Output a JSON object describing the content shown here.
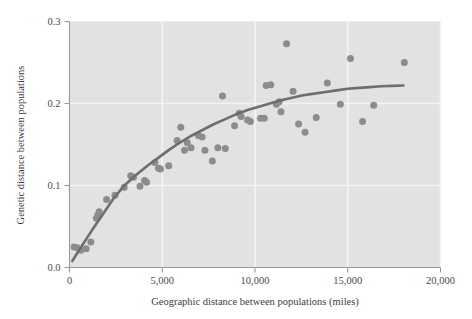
{
  "chart_data": {
    "type": "scatter",
    "title": "",
    "xlabel": "Geographic distance between populations (miles)",
    "ylabel": "Genetic distance between populations",
    "xlim": [
      0,
      20000
    ],
    "ylim": [
      0.0,
      0.3
    ],
    "xticks": [
      0,
      5000,
      10000,
      15000,
      20000
    ],
    "xtick_labels": [
      "0",
      "5,000",
      "10,000",
      "15,000",
      "20,000"
    ],
    "yticks": [
      0.0,
      0.1,
      0.2,
      0.3
    ],
    "ytick_labels": [
      "0.0",
      "0.1",
      "0.2",
      "0.3"
    ],
    "grid": true,
    "grid_color": "#f4f4f4",
    "plot_background": "#e2e2e2",
    "point_color": "#8c8c8c",
    "curve_color": "#6e6e6e",
    "legend": null,
    "annotations": [],
    "series": [
      {
        "name": "population pairs",
        "marker": "circle",
        "points": [
          [
            250,
            0.025
          ],
          [
            420,
            0.024
          ],
          [
            620,
            0.021
          ],
          [
            900,
            0.023
          ],
          [
            1150,
            0.031
          ],
          [
            1450,
            0.06
          ],
          [
            1520,
            0.064
          ],
          [
            1600,
            0.068
          ],
          [
            2000,
            0.083
          ],
          [
            2450,
            0.088
          ],
          [
            2950,
            0.098
          ],
          [
            3300,
            0.112
          ],
          [
            3450,
            0.11
          ],
          [
            3800,
            0.099
          ],
          [
            4050,
            0.106
          ],
          [
            4150,
            0.104
          ],
          [
            4600,
            0.128
          ],
          [
            4800,
            0.121
          ],
          [
            4900,
            0.12
          ],
          [
            5350,
            0.124
          ],
          [
            5800,
            0.155
          ],
          [
            6000,
            0.171
          ],
          [
            6200,
            0.143
          ],
          [
            6350,
            0.152
          ],
          [
            6550,
            0.146
          ],
          [
            6950,
            0.161
          ],
          [
            7150,
            0.159
          ],
          [
            7300,
            0.143
          ],
          [
            7700,
            0.13
          ],
          [
            8000,
            0.146
          ],
          [
            8250,
            0.209
          ],
          [
            8400,
            0.145
          ],
          [
            8900,
            0.173
          ],
          [
            9150,
            0.188
          ],
          [
            9250,
            0.184
          ],
          [
            9600,
            0.18
          ],
          [
            9750,
            0.178
          ],
          [
            10300,
            0.182
          ],
          [
            10500,
            0.182
          ],
          [
            10600,
            0.222
          ],
          [
            10850,
            0.223
          ],
          [
            11150,
            0.199
          ],
          [
            11300,
            0.202
          ],
          [
            11400,
            0.19
          ],
          [
            11700,
            0.273
          ],
          [
            12050,
            0.215
          ],
          [
            12350,
            0.175
          ],
          [
            12700,
            0.165
          ],
          [
            13300,
            0.183
          ],
          [
            13900,
            0.225
          ],
          [
            14600,
            0.199
          ],
          [
            15150,
            0.255
          ],
          [
            15800,
            0.178
          ],
          [
            16400,
            0.198
          ],
          [
            18050,
            0.25
          ]
        ]
      }
    ],
    "fit_curve": {
      "name": "fitted saturating curve",
      "points": [
        [
          150,
          0.008
        ],
        [
          600,
          0.024
        ],
        [
          1200,
          0.045
        ],
        [
          1800,
          0.065
        ],
        [
          2400,
          0.085
        ],
        [
          3000,
          0.101
        ],
        [
          3600,
          0.113
        ],
        [
          4200,
          0.124
        ],
        [
          4800,
          0.134
        ],
        [
          5400,
          0.144
        ],
        [
          6000,
          0.153
        ],
        [
          6600,
          0.161
        ],
        [
          7200,
          0.168
        ],
        [
          7800,
          0.175
        ],
        [
          8400,
          0.181
        ],
        [
          9000,
          0.187
        ],
        [
          9600,
          0.192
        ],
        [
          10200,
          0.196
        ],
        [
          10800,
          0.2
        ],
        [
          11400,
          0.204
        ],
        [
          12000,
          0.207
        ],
        [
          12600,
          0.21
        ],
        [
          13200,
          0.212
        ],
        [
          13800,
          0.214
        ],
        [
          14400,
          0.216
        ],
        [
          15000,
          0.218
        ],
        [
          15600,
          0.219
        ],
        [
          16200,
          0.22
        ],
        [
          16800,
          0.221
        ],
        [
          17400,
          0.2215
        ],
        [
          18000,
          0.222
        ]
      ]
    }
  }
}
